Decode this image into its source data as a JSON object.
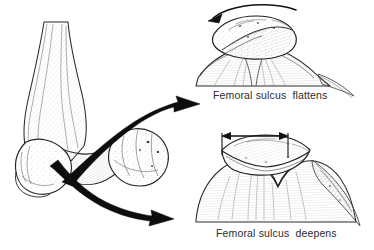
{
  "figure": {
    "background_color": "#ffffff",
    "ink_color": "#1a1a1a",
    "shading_color": "#8d8d8d",
    "text_color": "#2b2b2b"
  },
  "captions": {
    "top": "Femoral sulcus  flattens",
    "bottom": "Femoral sulcus  deepens"
  },
  "panels": [
    {
      "id": "left",
      "name": "distal-femur-oblique-view",
      "description": "Oblique view of the distal femur with medial and lateral condyles and intercondylar notch",
      "annotations": [
        {
          "name": "upper-motion-arrow",
          "shape": "thick-tapered-curved-arrow",
          "direction": "right",
          "color": "#0d0d0d"
        },
        {
          "name": "lower-motion-arrow",
          "shape": "thick-tapered-curved-arrow",
          "direction": "right",
          "color": "#0d0d0d"
        }
      ]
    },
    {
      "id": "top-right",
      "name": "patella-tilted-axial-view",
      "description": "Axial view of patella riding high on a shallow, flattened femoral sulcus",
      "annotations": [
        {
          "name": "rotation-arrow",
          "shape": "thin-curved-arrow",
          "direction": "left",
          "color": "#111111"
        }
      ]
    },
    {
      "id": "bottom-right",
      "name": "patella-seated-axial-view",
      "description": "Axial view of patella seated in a deep femoral sulcus",
      "annotations": [
        {
          "name": "width-measurement-arrow",
          "shape": "double-headed-arrow-with-end-ticks",
          "direction": "horizontal",
          "color": "#111111"
        }
      ]
    }
  ]
}
